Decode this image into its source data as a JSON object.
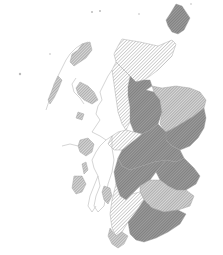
{
  "map": {
    "subject": "Scotland",
    "style": "hatched grayscale choropleth",
    "classes": [
      {
        "id": "low",
        "pattern": "light single hatch",
        "color": "#bdbdbd"
      },
      {
        "id": "medium",
        "pattern": "single hatch",
        "color": "#9a9a9a"
      },
      {
        "id": "high",
        "pattern": "dense cross hatch",
        "color": "#6e6e6e"
      }
    ],
    "colors": {
      "background": "#ffffff",
      "outline": "#b8b8b8",
      "hatch_light": "#bdbdbd",
      "hatch_medium": "#9a9a9a",
      "hatch_dark": "#6e6e6e"
    },
    "regions": [
      {
        "name": "shetland",
        "class": "high"
      },
      {
        "name": "far-north",
        "class": "low"
      },
      {
        "name": "north-highland-east",
        "class": "low"
      },
      {
        "name": "west-highland",
        "class": "high"
      },
      {
        "name": "grampian-west",
        "class": "medium"
      },
      {
        "name": "grampian-east",
        "class": "high"
      },
      {
        "name": "central-belt-north",
        "class": "high"
      },
      {
        "name": "tayside",
        "class": "medium"
      },
      {
        "name": "fife-lothian",
        "class": "high"
      },
      {
        "name": "argyll",
        "class": "low"
      },
      {
        "name": "strathclyde",
        "class": "high"
      },
      {
        "name": "borders",
        "class": "medium"
      },
      {
        "name": "dumfries-galloway",
        "class": "high"
      },
      {
        "name": "ayrshire",
        "class": "low"
      },
      {
        "name": "western-isles",
        "class": "medium"
      },
      {
        "name": "skye",
        "class": "medium"
      },
      {
        "name": "mull",
        "class": "medium"
      },
      {
        "name": "islay",
        "class": "medium"
      },
      {
        "name": "arran",
        "class": "medium"
      }
    ]
  }
}
